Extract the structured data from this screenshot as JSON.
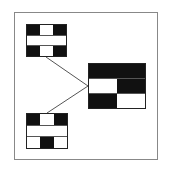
{
  "diagram": {
    "type": "block-connection-diagram",
    "colors": {
      "filled": "#111111",
      "empty": "#ffffff",
      "frame": "#888888",
      "line": "#555555"
    },
    "blocks": [
      {
        "id": "top-left",
        "rows": [
          [
            "b",
            "w",
            "b"
          ],
          [
            "w"
          ],
          [
            "b",
            "w",
            "b"
          ]
        ]
      },
      {
        "id": "right",
        "rows": [
          [
            "b"
          ],
          [
            "w",
            "b"
          ],
          [
            "b",
            "w"
          ]
        ]
      },
      {
        "id": "bottom-left",
        "rows": [
          [
            "b",
            "w",
            "b"
          ],
          [
            "w"
          ],
          [
            "w",
            "b",
            "w"
          ]
        ]
      }
    ],
    "connections": [
      {
        "from": "top-left",
        "to": "right"
      },
      {
        "from": "bottom-left",
        "to": "right"
      }
    ]
  }
}
